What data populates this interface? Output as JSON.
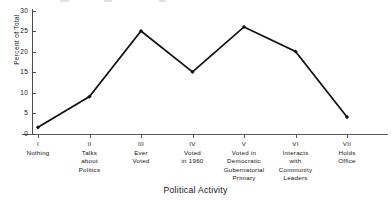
{
  "chart_data": {
    "type": "line",
    "title": "",
    "xlabel": "Political Activity",
    "ylabel": "Percent of Total",
    "ylim": [
      0,
      30
    ],
    "yticks": [
      0,
      5,
      10,
      15,
      20,
      25,
      30
    ],
    "ytick_labels": [
      "0",
      "5",
      "10",
      "15",
      "20",
      "25",
      "30"
    ],
    "grid": false,
    "legend": "none",
    "markers": "filled-diamond",
    "line_color": "#111111",
    "categories": [
      "I Nothing",
      "II Talks about Politics",
      "III Ever Voted",
      "IV Voted in 1960",
      "V Voted in Democratic Gubernatorial Primary",
      "VI Interacts with Community Leaders",
      "VII Holds Office"
    ],
    "values": [
      1.5,
      9,
      25,
      15,
      26,
      20,
      4
    ]
  },
  "axis": {
    "y_label": "Percent of Total",
    "x_label": "Political Activity",
    "y_ticks": [
      {
        "value": 30,
        "label": "30"
      },
      {
        "value": 25,
        "label": "25"
      },
      {
        "value": 20,
        "label": "20"
      },
      {
        "value": 15,
        "label": "15"
      },
      {
        "value": 10,
        "label": "10"
      },
      {
        "value": 5,
        "label": "5"
      },
      {
        "value": 0,
        "label": "0"
      }
    ]
  },
  "categories": [
    {
      "roman": "I",
      "lines": [
        "Nothing"
      ]
    },
    {
      "roman": "II",
      "lines": [
        "Talks",
        "about",
        "Politics"
      ]
    },
    {
      "roman": "III",
      "lines": [
        "Ever",
        "Voted"
      ]
    },
    {
      "roman": "IV",
      "lines": [
        "Voted",
        "in 1960"
      ]
    },
    {
      "roman": "V",
      "lines": [
        "Voted in",
        "Democratic",
        "Gubernatorial",
        "Primary"
      ]
    },
    {
      "roman": "VI",
      "lines": [
        "Interacts",
        "with",
        "Community",
        "Leaders"
      ]
    },
    {
      "roman": "VII",
      "lines": [
        "Holds",
        "Office"
      ]
    }
  ]
}
